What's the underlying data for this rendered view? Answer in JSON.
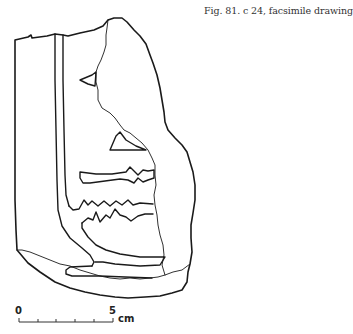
{
  "figure": {
    "caption": "Fig. 81. c 24, facsimile drawing",
    "line_color": "#1a1a1a",
    "background": "#ffffff"
  },
  "scale_bar": {
    "start_label": "0",
    "end_label": "5",
    "unit": "cm",
    "ticks": 6
  }
}
